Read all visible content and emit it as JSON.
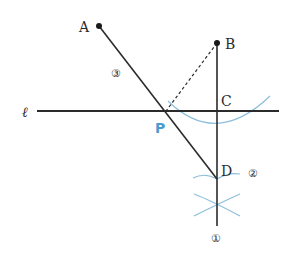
{
  "diagram": {
    "type": "geometric-construction",
    "colors": {
      "ink": "#2b2b2b",
      "construction": "#7fb6d6",
      "point_p": "#4a9bd0"
    },
    "line": {
      "label": "ℓ"
    },
    "points": [
      {
        "id": "A",
        "label": "A"
      },
      {
        "id": "B",
        "label": "B"
      },
      {
        "id": "C",
        "label": "C"
      },
      {
        "id": "D",
        "label": "D"
      },
      {
        "id": "P",
        "label": "P"
      }
    ],
    "step_markers": [
      {
        "label": "①"
      },
      {
        "label": "②"
      },
      {
        "label": "③"
      }
    ],
    "segments": [
      {
        "from": "A",
        "to": "D",
        "style": "solid"
      },
      {
        "from": "B",
        "to": "P",
        "style": "dashed"
      },
      {
        "from": "B",
        "to": "D",
        "style": "solid",
        "note": "perpendicular to ℓ"
      }
    ]
  }
}
